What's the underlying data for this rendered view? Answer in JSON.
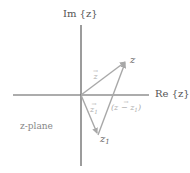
{
  "diagram": {
    "type": "complex-plane-vector-diagram",
    "colors": {
      "axis": "#5a5a5a",
      "vector": "#a8a8a8",
      "axis_label": "#555555",
      "vector_label": "#aaaaaa",
      "background": "#ffffff"
    },
    "axes": {
      "imag_label": "Im {z}",
      "real_label": "Re {z}"
    },
    "plane_label": "z-plane",
    "points": {
      "z": "z",
      "z1": "z",
      "z1_sub": "1"
    },
    "vectors": {
      "z_vec": "z",
      "z1_vec": "z",
      "z1_vec_sub": "1",
      "diff_vec_open": "(z − z",
      "diff_vec_sub": "1",
      "diff_vec_close": ")",
      "arrow": "→"
    },
    "geometry": {
      "origin": [
        81,
        95
      ],
      "z_point": [
        126,
        61
      ],
      "z1_point": [
        98,
        135
      ]
    }
  }
}
